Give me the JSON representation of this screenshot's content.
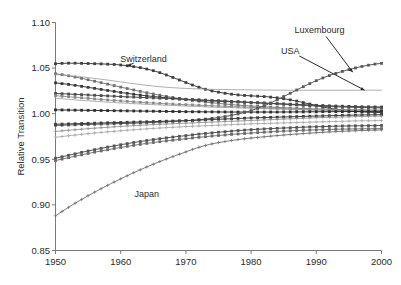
{
  "chart_data": {
    "type": "line",
    "title": "",
    "xlabel": "",
    "ylabel": "Relative Transition",
    "xlim": [
      1950,
      2000
    ],
    "ylim": [
      0.85,
      1.1
    ],
    "xticks": [
      1950,
      1960,
      1970,
      1980,
      1990,
      2000
    ],
    "xticklabels": [
      "1950",
      "1960",
      "1970",
      "1980",
      "1990",
      "2000"
    ],
    "yticks": [
      0.85,
      0.9,
      0.95,
      1.0,
      1.05,
      1.1
    ],
    "yticklabels": [
      "0.85",
      "0.90",
      "0.95",
      "1.00",
      "1.05",
      "1.10"
    ],
    "grid": false,
    "legend": "none",
    "annotations": [
      {
        "label": "Switzerland",
        "x": 1963.5,
        "y": 1.0565,
        "points_to_x": 1961.0,
        "points_to_y": 1.0525
      },
      {
        "label": "Luxembourg",
        "x": 1990.5,
        "y": 1.0885,
        "points_to_x": 1995.6,
        "points_to_y": 1.0455
      },
      {
        "label": "USA",
        "x": 1986.0,
        "y": 1.0655,
        "points_to_x": 1997.4,
        "points_to_y": 1.0258
      },
      {
        "label": "Japan",
        "x": 1964.0,
        "y": 0.9085,
        "points_to_x": 1957.5,
        "points_to_y": 0.9255
      }
    ],
    "x": [
      1950,
      1951,
      1952,
      1953,
      1954,
      1955,
      1956,
      1957,
      1958,
      1959,
      1960,
      1961,
      1962,
      1963,
      1964,
      1965,
      1966,
      1967,
      1968,
      1969,
      1970,
      1971,
      1972,
      1973,
      1974,
      1975,
      1976,
      1977,
      1978,
      1979,
      1980,
      1981,
      1982,
      1983,
      1984,
      1985,
      1986,
      1987,
      1988,
      1989,
      1990,
      1991,
      1992,
      1993,
      1994,
      1995,
      1996,
      1997,
      1998,
      1999,
      2000
    ],
    "series": [
      {
        "name": "Switzerland",
        "marker": "square",
        "color": "#404040",
        "width": 1.0,
        "values": [
          1.0548,
          1.0552,
          1.0554,
          1.0554,
          1.0552,
          1.055,
          1.0548,
          1.0546,
          1.0543,
          1.054,
          1.0534,
          1.0526,
          1.0516,
          1.0505,
          1.049,
          1.0472,
          1.045,
          1.0425,
          1.0398,
          1.037,
          1.0342,
          1.0315,
          1.029,
          1.0268,
          1.025,
          1.0236,
          1.0224,
          1.0214,
          1.0206,
          1.02,
          1.0196,
          1.0192,
          1.0188,
          1.0182,
          1.0174,
          1.0164,
          1.0152,
          1.0138,
          1.0122,
          1.0106,
          1.009,
          1.0074,
          1.006,
          1.0048,
          1.0038,
          1.003,
          1.0024,
          1.002,
          1.0016,
          1.0014,
          1.0012
        ]
      },
      {
        "name": "series-2-high",
        "marker": "square",
        "color": "#707070",
        "width": 0.9,
        "values": [
          1.0438,
          1.0428,
          1.0416,
          1.0402,
          1.0388,
          1.0372,
          1.0356,
          1.034,
          1.0324,
          1.0308,
          1.0292,
          1.0276,
          1.026,
          1.0245,
          1.023,
          1.0216,
          1.0203,
          1.019,
          1.0178,
          1.0167,
          1.0156,
          1.0146,
          1.0137,
          1.0128,
          1.012,
          1.0113,
          1.0106,
          1.01,
          1.0094,
          1.0089,
          1.0084,
          1.008,
          1.0076,
          1.0072,
          1.0068,
          1.0065,
          1.0062,
          1.0059,
          1.0056,
          1.0054,
          1.0052,
          1.005,
          1.0048,
          1.0046,
          1.0045,
          1.0044,
          1.0043,
          1.0042,
          1.0041,
          1.004,
          1.004
        ]
      },
      {
        "name": "USA",
        "marker": "none",
        "color": "#9a9a9a",
        "width": 0.8,
        "values": [
          1.043,
          1.0424,
          1.0418,
          1.0411,
          1.0404,
          1.0396,
          1.0387,
          1.0378,
          1.0369,
          1.0359,
          1.0349,
          1.0339,
          1.0329,
          1.032,
          1.0311,
          1.0303,
          1.0296,
          1.029,
          1.0285,
          1.0281,
          1.0277,
          1.0274,
          1.0271,
          1.0269,
          1.0267,
          1.0266,
          1.0265,
          1.0264,
          1.0263,
          1.0262,
          1.0261,
          1.026,
          1.0259,
          1.0259,
          1.0258,
          1.0258,
          1.0257,
          1.0257,
          1.0257,
          1.0257,
          1.0257,
          1.0257,
          1.0257,
          1.0257,
          1.0257,
          1.0257,
          1.0257,
          1.0258,
          1.0258,
          1.0258,
          1.0258
        ]
      },
      {
        "name": "series-4",
        "marker": "square",
        "color": "#3a3a3a",
        "width": 1.0,
        "values": [
          1.0338,
          1.033,
          1.0321,
          1.0311,
          1.03,
          1.0289,
          1.0278,
          1.0266,
          1.0255,
          1.0244,
          1.0233,
          1.0223,
          1.0213,
          1.0204,
          1.0196,
          1.0188,
          1.0181,
          1.0174,
          1.0168,
          1.0162,
          1.0157,
          1.0152,
          1.0148,
          1.0144,
          1.014,
          1.0137,
          1.0134,
          1.0131,
          1.0128,
          1.0125,
          1.0122,
          1.0119,
          1.0116,
          1.0113,
          1.011,
          1.0107,
          1.0104,
          1.0101,
          1.0098,
          1.0095,
          1.0092,
          1.0089,
          1.0086,
          1.0084,
          1.0082,
          1.008,
          1.0078,
          1.0076,
          1.0075,
          1.0074,
          1.0073
        ]
      },
      {
        "name": "series-5",
        "marker": "square",
        "color": "#4d4d4d",
        "width": 1.0,
        "values": [
          1.0222,
          1.0219,
          1.0216,
          1.0212,
          1.0209,
          1.0205,
          1.0202,
          1.0198,
          1.0195,
          1.0192,
          1.0188,
          1.0185,
          1.0182,
          1.0179,
          1.0176,
          1.0173,
          1.017,
          1.0167,
          1.0164,
          1.0161,
          1.0158,
          1.0155,
          1.0152,
          1.0149,
          1.0146,
          1.0143,
          1.014,
          1.0136,
          1.0132,
          1.0128,
          1.0124,
          1.012,
          1.0116,
          1.0112,
          1.0108,
          1.0104,
          1.01,
          1.0096,
          1.0092,
          1.0088,
          1.0085,
          1.0082,
          1.0079,
          1.0076,
          1.0074,
          1.0072,
          1.007,
          1.0068,
          1.0066,
          1.0065,
          1.0064
        ]
      },
      {
        "name": "series-6",
        "marker": "square",
        "color": "#8a8a8a",
        "width": 0.9,
        "values": [
          1.0198,
          1.0192,
          1.0186,
          1.018,
          1.0174,
          1.0168,
          1.0162,
          1.0156,
          1.015,
          1.0145,
          1.014,
          1.0135,
          1.013,
          1.0125,
          1.0121,
          1.0117,
          1.0113,
          1.0109,
          1.0105,
          1.0102,
          1.0099,
          1.0096,
          1.0093,
          1.009,
          1.0087,
          1.0084,
          1.0081,
          1.0078,
          1.0075,
          1.0072,
          1.0069,
          1.0066,
          1.0063,
          1.006,
          1.0057,
          1.0054,
          1.0051,
          1.0048,
          1.0046,
          1.0044,
          1.0042,
          1.004,
          1.0038,
          1.0036,
          1.0034,
          1.0033,
          1.0032,
          1.0031,
          1.003,
          1.0029,
          1.0028
        ]
      },
      {
        "name": "series-7-thin-rising",
        "marker": "none",
        "color": "#9e9e9e",
        "width": 0.8,
        "values": [
          1.017,
          1.0164,
          1.0158,
          1.0152,
          1.0146,
          1.0141,
          1.0136,
          1.0131,
          1.0126,
          1.0122,
          1.0118,
          1.0114,
          1.011,
          1.0106,
          1.0102,
          1.0099,
          1.0096,
          1.0093,
          1.009,
          1.0087,
          1.0084,
          1.0081,
          1.0078,
          1.0075,
          1.0072,
          1.007,
          1.0068,
          1.0066,
          1.0064,
          1.0062,
          1.006,
          1.0058,
          1.0056,
          1.0054,
          1.0052,
          1.005,
          1.0048,
          1.0046,
          1.0044,
          1.0042,
          1.0041,
          1.004,
          1.0039,
          1.0038,
          1.0037,
          1.0036,
          1.0035,
          1.0034,
          1.0033,
          1.0032,
          1.0031
        ]
      },
      {
        "name": "series-8-flat",
        "marker": "square",
        "color": "#2e2e2e",
        "width": 1.0,
        "values": [
          1.0042,
          1.0041,
          1.004,
          1.0039,
          1.0038,
          1.0037,
          1.0036,
          1.0035,
          1.0034,
          1.0033,
          1.0032,
          1.0031,
          1.003,
          1.0029,
          1.0028,
          1.0027,
          1.0026,
          1.0025,
          1.0024,
          1.0023,
          1.0022,
          1.0021,
          1.0021,
          1.002,
          1.002,
          1.0019,
          1.0019,
          1.0018,
          1.0018,
          1.0018,
          1.0018,
          1.0018,
          1.0018,
          1.0018,
          1.0018,
          1.0019,
          1.0019,
          1.002,
          1.002,
          1.0021,
          1.0021,
          1.0022,
          1.0022,
          1.0023,
          1.0023,
          1.0024,
          1.0024,
          1.0025,
          1.0025,
          1.0026,
          1.0026
        ]
      },
      {
        "name": "Luxembourg",
        "marker": "square",
        "color": "#5a5a5a",
        "width": 1.0,
        "values": [
          0.9872,
          0.9874,
          0.9876,
          0.9878,
          0.988,
          0.9882,
          0.9884,
          0.9886,
          0.9888,
          0.989,
          0.9892,
          0.9894,
          0.9896,
          0.9899,
          0.9902,
          0.9905,
          0.9908,
          0.9911,
          0.9915,
          0.9919,
          0.9923,
          0.9928,
          0.9934,
          0.9941,
          0.9949,
          0.9958,
          0.9969,
          0.9982,
          0.9997,
          1.0014,
          1.0034,
          1.0058,
          1.0086,
          1.0118,
          1.0152,
          1.0188,
          1.0224,
          1.026,
          1.0296,
          1.033,
          1.0362,
          1.0392,
          1.0418,
          1.0442,
          1.0464,
          1.0484,
          1.0502,
          1.0518,
          1.0532,
          1.0544,
          1.0552
        ]
      },
      {
        "name": "series-10",
        "marker": "square",
        "color": "#3f3f3f",
        "width": 1.0,
        "values": [
          0.9884,
          0.9886,
          0.9888,
          0.989,
          0.9892,
          0.9894,
          0.9896,
          0.9898,
          0.99,
          0.9902,
          0.9904,
          0.9906,
          0.9908,
          0.991,
          0.9912,
          0.9914,
          0.9916,
          0.9918,
          0.992,
          0.9922,
          0.9924,
          0.9927,
          0.993,
          0.9933,
          0.9936,
          0.9939,
          0.9942,
          0.9945,
          0.9948,
          0.9951,
          0.9954,
          0.9956,
          0.9958,
          0.996,
          0.9962,
          0.9964,
          0.9966,
          0.9968,
          0.997,
          0.9972,
          0.9974,
          0.9976,
          0.9978,
          0.998,
          0.9982,
          0.9984,
          0.9985,
          0.9986,
          0.9987,
          0.9988,
          0.9989
        ]
      },
      {
        "name": "series-11",
        "marker": "cross",
        "color": "#8e8e8e",
        "width": 0.8,
        "values": [
          0.9806,
          0.9812,
          0.9818,
          0.9824,
          0.983,
          0.9836,
          0.9841,
          0.9846,
          0.9851,
          0.9856,
          0.9861,
          0.9865,
          0.9869,
          0.9873,
          0.9877,
          0.9881,
          0.9884,
          0.9887,
          0.989,
          0.9893,
          0.9896,
          0.9899,
          0.9902,
          0.9905,
          0.9908,
          0.9911,
          0.9914,
          0.9917,
          0.992,
          0.9923,
          0.9926,
          0.9929,
          0.9932,
          0.9935,
          0.9938,
          0.9941,
          0.9944,
          0.9947,
          0.995,
          0.9953,
          0.9956,
          0.9958,
          0.996,
          0.9962,
          0.9964,
          0.9966,
          0.9968,
          0.997,
          0.9972,
          0.9973,
          0.9974
        ]
      },
      {
        "name": "series-12",
        "marker": "cross",
        "color": "#a5a5a5",
        "width": 0.8,
        "values": [
          0.9742,
          0.975,
          0.9758,
          0.9766,
          0.9774,
          0.9781,
          0.9788,
          0.9795,
          0.9801,
          0.9807,
          0.9813,
          0.9819,
          0.9824,
          0.9829,
          0.9834,
          0.9839,
          0.9843,
          0.9847,
          0.9851,
          0.9855,
          0.9859,
          0.9862,
          0.9865,
          0.9868,
          0.9871,
          0.9874,
          0.9877,
          0.988,
          0.9883,
          0.9886,
          0.9889,
          0.9891,
          0.9893,
          0.9895,
          0.9897,
          0.9899,
          0.9901,
          0.9903,
          0.9905,
          0.9907,
          0.9909,
          0.9911,
          0.9913,
          0.9915,
          0.9917,
          0.9919,
          0.9921,
          0.9922,
          0.9923,
          0.9924,
          0.9925
        ]
      },
      {
        "name": "series-13",
        "marker": "square",
        "color": "#555555",
        "width": 1.0,
        "values": [
          0.9512,
          0.9528,
          0.9544,
          0.956,
          0.9576,
          0.9591,
          0.9606,
          0.962,
          0.9634,
          0.9647,
          0.966,
          0.9672,
          0.9684,
          0.9695,
          0.9706,
          0.9716,
          0.9726,
          0.9735,
          0.9744,
          0.9752,
          0.976,
          0.9768,
          0.9776,
          0.9783,
          0.979,
          0.9797,
          0.9803,
          0.9809,
          0.9815,
          0.982,
          0.9825,
          0.9829,
          0.9833,
          0.9837,
          0.984,
          0.9843,
          0.9846,
          0.9849,
          0.9852,
          0.9855,
          0.9857,
          0.9859,
          0.9861,
          0.9863,
          0.9865,
          0.9866,
          0.9867,
          0.9868,
          0.9869,
          0.987,
          0.9871
        ]
      },
      {
        "name": "series-14",
        "marker": "square",
        "color": "#6a6a6a",
        "width": 0.9,
        "values": [
          0.9486,
          0.9502,
          0.9518,
          0.9534,
          0.9549,
          0.9564,
          0.9578,
          0.9592,
          0.9605,
          0.9618,
          0.963,
          0.9642,
          0.9653,
          0.9664,
          0.9674,
          0.9684,
          0.9693,
          0.9702,
          0.971,
          0.9718,
          0.9726,
          0.9734,
          0.9741,
          0.9748,
          0.9755,
          0.9761,
          0.9767,
          0.9773,
          0.9778,
          0.9783,
          0.9788,
          0.9793,
          0.9797,
          0.9801,
          0.9805,
          0.9809,
          0.9812,
          0.9815,
          0.9818,
          0.9821,
          0.9823,
          0.9825,
          0.9827,
          0.9829,
          0.9831,
          0.9832,
          0.9833,
          0.9834,
          0.9835,
          0.9836,
          0.9837
        ]
      },
      {
        "name": "Japan",
        "marker": "cross",
        "color": "#707070",
        "width": 0.9,
        "values": [
          0.888,
          0.8928,
          0.8974,
          0.9018,
          0.906,
          0.9101,
          0.914,
          0.9178,
          0.9215,
          0.9251,
          0.9286,
          0.932,
          0.9353,
          0.9385,
          0.9416,
          0.9446,
          0.9475,
          0.9503,
          0.953,
          0.9556,
          0.9581,
          0.9608,
          0.9632,
          0.9652,
          0.9669,
          0.9683,
          0.9695,
          0.9706,
          0.9716,
          0.9725,
          0.9733,
          0.974,
          0.9747,
          0.9754,
          0.976,
          0.9766,
          0.9772,
          0.9777,
          0.9782,
          0.9787,
          0.9792,
          0.9796,
          0.98,
          0.9804,
          0.9807,
          0.981,
          0.9813,
          0.9816,
          0.9818,
          0.982,
          0.9822
        ]
      }
    ]
  }
}
